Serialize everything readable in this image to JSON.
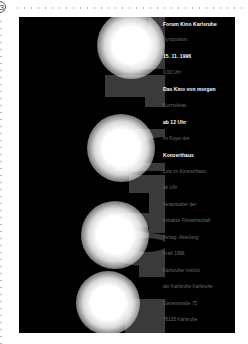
{
  "page": {
    "badge_label": "3"
  },
  "poster": {
    "background": "#000000",
    "vertical_word": "Forum",
    "letter_color": "#3a3a3a",
    "orbs": [
      {
        "cx": 112,
        "cy": 28,
        "r": 34
      },
      {
        "cx": 102,
        "cy": 131,
        "r": 34
      },
      {
        "cx": 96,
        "cy": 218,
        "r": 34
      },
      {
        "cx": 89,
        "cy": 286,
        "r": 32
      }
    ],
    "text_lines": [
      {
        "text": "Forum Kino Karlsruhe",
        "bold": true,
        "y": 6
      },
      {
        "text": "Symposium",
        "bold": false,
        "y": 22
      },
      {
        "text": "15. 11. 1996",
        "bold": true,
        "y": 38
      },
      {
        "text": "9.00 Uhr",
        "bold": false,
        "y": 55
      },
      {
        "text": "Das Kino von morgen",
        "bold": true,
        "y": 71
      },
      {
        "text": "Kurzreferat",
        "bold": false,
        "y": 88
      },
      {
        "text": "ab 12 Uhr",
        "bold": true,
        "y": 104
      },
      {
        "text": "Im Foyer der",
        "bold": false,
        "y": 121
      },
      {
        "text": "Konzerthaus",
        "bold": true,
        "y": 137
      },
      {
        "text": "Lutz im Konzerthaus",
        "bold": false,
        "y": 154
      },
      {
        "text": "ab Uhr",
        "bold": false,
        "y": 170
      },
      {
        "text": "Veranstalter der",
        "bold": false,
        "y": 187
      },
      {
        "text": "Initiative Filmwirtschaft",
        "bold": false,
        "y": 203
      },
      {
        "text": "Verlag: Abteilung",
        "bold": false,
        "y": 220
      },
      {
        "text": "Kraft 1996",
        "bold": false,
        "y": 236
      },
      {
        "text": "Karlsruher Institut",
        "bold": false,
        "y": 253
      },
      {
        "text": "der Karlsruhe Karlsruhe",
        "bold": false,
        "y": 269
      },
      {
        "text": "Gartenstraße 75",
        "bold": false,
        "y": 286
      },
      {
        "text": "76135 Karlsruhe",
        "bold": false,
        "y": 302
      }
    ]
  }
}
